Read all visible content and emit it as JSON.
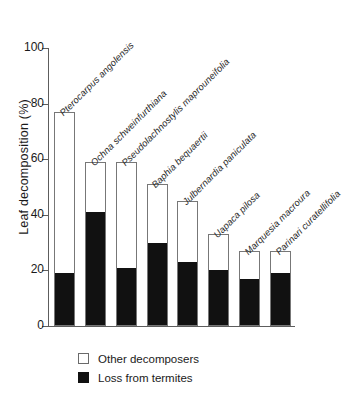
{
  "chart_data": {
    "type": "bar",
    "title": "",
    "subtitle": "",
    "xlabel": "",
    "ylabel": "Leaf decomposition (%)",
    "ylim": [
      0,
      100
    ],
    "yticks": [
      0,
      20,
      40,
      60,
      80,
      100
    ],
    "ytick_labels": [
      "0",
      "20",
      "40",
      "60",
      "80",
      "100"
    ],
    "grid": false,
    "stacked": true,
    "legend_position": "bottom-left",
    "categories": [
      "Pterocarpus angolensis",
      "Ochna schweinfurthiana",
      "Pseudolachnostylis maprouneifolia",
      "Baphia bequaertii",
      "Julbernardia paniculata",
      "Uapaca pilosa",
      "Marquesia macroura",
      "Parinari curatellifolia"
    ],
    "series": [
      {
        "name": "Loss from termites",
        "color": "#111111",
        "values": [
          19,
          41,
          21,
          30,
          23,
          20,
          17,
          19
        ]
      },
      {
        "name": "Other decomposers",
        "color": "#ffffff",
        "values": [
          58,
          18,
          38,
          21,
          22,
          13,
          10,
          8
        ]
      }
    ],
    "totals": [
      77,
      59,
      59,
      51,
      45,
      33,
      27,
      27
    ],
    "annotations": []
  },
  "legend": {
    "items": [
      {
        "label": "Other decomposers",
        "swatch": "white"
      },
      {
        "label": "Loss from termites",
        "swatch": "black"
      }
    ]
  }
}
